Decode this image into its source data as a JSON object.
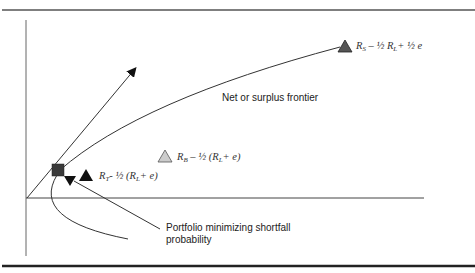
{
  "figure": {
    "caption": "Figure 11.7",
    "labels": {
      "frontier": "Net or surplus frontier",
      "shortfall_line1": "Portfolio minimizing shortfall",
      "shortfall_line2": "probability"
    },
    "points": [
      {
        "id": "RS",
        "marker": "dark-gray-triangle",
        "sym": "R",
        "sub": "S",
        "expr": " – ½ R",
        "sub2": "L",
        "tail": "+ ½ e"
      },
      {
        "id": "RB",
        "marker": "light-gray-triangle",
        "sym": "R",
        "sub": "B",
        "expr": " – ½ (R",
        "sub2": "L",
        "tail": "+ e)"
      },
      {
        "id": "RT",
        "marker": "black-triangle",
        "sym": "R",
        "sub": "T",
        "expr": "- ½ (R",
        "sub2": "L",
        "tail": "+ e)"
      },
      {
        "id": "min-shortfall",
        "marker": "dark-square"
      }
    ],
    "colors": {
      "line": "#333333",
      "dark_triangle": "#555555",
      "light_triangle": "#cccccc",
      "black_triangle": "#111111",
      "square": "#3a3a3a",
      "rule": "#333333"
    }
  }
}
